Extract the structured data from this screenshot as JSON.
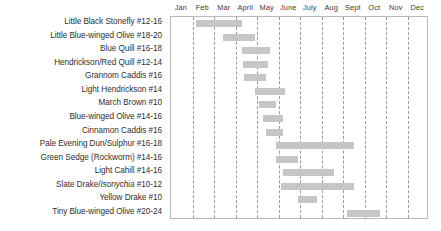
{
  "chart_data": {
    "type": "bar",
    "title": "",
    "xlabel": "",
    "ylabel": "",
    "orientation": "horizontal",
    "grid": true,
    "legend": "none",
    "xlim": [
      0,
      12
    ],
    "x_tick_labels": [
      "Jan",
      "Feb",
      "Mar",
      "April",
      "May",
      "June",
      "July",
      "Aug",
      "Sept",
      "Oct",
      "Nov",
      "Dec"
    ],
    "categories": [
      "Little Black Stonefly #12-16",
      "Little Blue-winged Olive  #18-20",
      "Blue Quill #16-18",
      "Hendrickson/Red Quill #12-14",
      "Grannom Caddis #16",
      "Light Hendrickson #14",
      "March Brown #10",
      "Blue-winged Olive #14-16",
      "Cinnamon Caddis #16",
      "Pale Evening Dun/Sulphur #16-18",
      "Green Sedge (Rockworm) #14-16",
      "Light Cahill #14-16",
      "Slate Drake/Isonychia #10-12",
      "Yellow Drake #10",
      "Tiny Blue-winged Olive #20-24"
    ],
    "series": [
      {
        "name": "Hatch period",
        "color": "#c6c6c6",
        "spans": [
          {
            "category": "Little Black Stonefly #12-16",
            "start_month": 1.15,
            "end_month": 3.3,
            "start_label": "early Feb",
            "end_label": "mid April"
          },
          {
            "category": "Little Blue-winged Olive  #18-20",
            "start_month": 2.4,
            "end_month": 3.9,
            "start_label": "mid Mar",
            "end_label": "late April"
          },
          {
            "category": "Blue Quill #16-18",
            "start_month": 3.3,
            "end_month": 4.6,
            "start_label": "mid April",
            "end_label": "mid May"
          },
          {
            "category": "Hendrickson/Red Quill #12-14",
            "start_month": 3.35,
            "end_month": 4.5,
            "start_label": "mid April",
            "end_label": "mid May"
          },
          {
            "category": "Grannom Caddis #16",
            "start_month": 3.4,
            "end_month": 4.4,
            "start_label": "mid April",
            "end_label": "early May"
          },
          {
            "category": "Light Hendrickson #14",
            "start_month": 3.9,
            "end_month": 5.3,
            "start_label": "late April",
            "end_label": "mid June"
          },
          {
            "category": "March Brown #10",
            "start_month": 4.1,
            "end_month": 4.9,
            "start_label": "early May",
            "end_label": "late May"
          },
          {
            "category": "Blue-winged Olive #14-16",
            "start_month": 4.3,
            "end_month": 5.2,
            "start_label": "mid May",
            "end_label": "early June"
          },
          {
            "category": "Cinnamon Caddis #16",
            "start_month": 4.4,
            "end_month": 5.2,
            "start_label": "mid May",
            "end_label": "early June"
          },
          {
            "category": "Pale Evening Dun/Sulphur #16-18",
            "start_month": 4.9,
            "end_month": 8.5,
            "start_label": "late May",
            "end_label": "mid Sept"
          },
          {
            "category": "Green Sedge (Rockworm) #14-16",
            "start_month": 4.9,
            "end_month": 5.9,
            "start_label": "late May",
            "end_label": "late June"
          },
          {
            "category": "Light Cahill #14-16",
            "start_month": 5.2,
            "end_month": 7.6,
            "start_label": "early June",
            "end_label": "mid Aug"
          },
          {
            "category": "Slate Drake/Isonychia #10-12",
            "start_month": 5.1,
            "end_month": 8.5,
            "start_label": "early June",
            "end_label": "mid Sept"
          },
          {
            "category": "Yellow Drake #10",
            "start_month": 5.9,
            "end_month": 6.8,
            "start_label": "late June",
            "end_label": "late July"
          },
          {
            "category": "Tiny Blue-winged Olive #20-24",
            "start_month": 8.2,
            "end_month": 9.7,
            "start_label": "early Sept",
            "end_label": "late Oct"
          }
        ]
      }
    ]
  },
  "style": {
    "bar_color": "#c6c6c6",
    "gridline_color": "#9a9a9a",
    "frame_color": "#b9b9b9",
    "text_color": "#2f2f2f",
    "background": "#ffffff"
  }
}
